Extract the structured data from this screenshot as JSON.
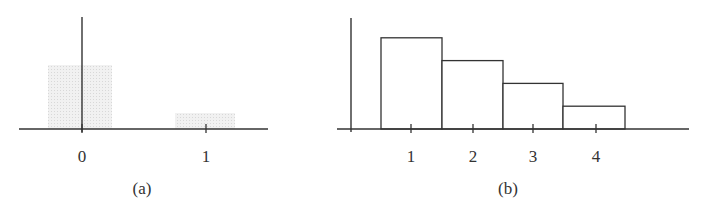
{
  "chart_data": [
    {
      "panel": "(a)",
      "type": "bar",
      "style": "shaded",
      "categories": [
        "0",
        "1"
      ],
      "values": [
        0.8,
        0.2
      ],
      "title": "",
      "caption": "(a)",
      "xlabel": "",
      "ylabel": "",
      "x_ticks": [
        "0",
        "1"
      ],
      "grid": false,
      "legend": null,
      "bar_fill": "#ececec",
      "geometry": {
        "axis_y": 129,
        "axis_x0": 19,
        "axis_x1": 268,
        "vaxis_x": 82,
        "vaxis_top": 17,
        "px_per_unit": 80,
        "bars": [
          {
            "x0": 48,
            "x1": 112,
            "tick": 82,
            "label": "0"
          },
          {
            "x0": 175,
            "x1": 235,
            "tick": 206,
            "label": "1"
          }
        ],
        "caption_x": 142
      }
    },
    {
      "panel": "(b)",
      "type": "bar",
      "style": "outlined",
      "categories": [
        "1",
        "2",
        "3",
        "4"
      ],
      "values": [
        0.4,
        0.3,
        0.2,
        0.1
      ],
      "title": "",
      "caption": "(b)",
      "xlabel": "",
      "ylabel": "",
      "x_ticks": [
        "1",
        "2",
        "3",
        "4"
      ],
      "grid": false,
      "legend": null,
      "bar_fill": "#ffffff",
      "geometry": {
        "axis_y": 129,
        "axis_x0": 337,
        "axis_x1": 689,
        "vaxis_x": 351,
        "vaxis_top": 18,
        "px_per_unit": 228,
        "bars": [
          {
            "x0": 381,
            "x1": 442,
            "tick": 411,
            "label": "1"
          },
          {
            "x0": 442,
            "x1": 503,
            "tick": 473,
            "label": "2"
          },
          {
            "x0": 503,
            "x1": 563,
            "tick": 533,
            "label": "3"
          },
          {
            "x0": 563,
            "x1": 625,
            "tick": 596,
            "label": "4"
          }
        ],
        "caption_x": 508
      }
    }
  ]
}
